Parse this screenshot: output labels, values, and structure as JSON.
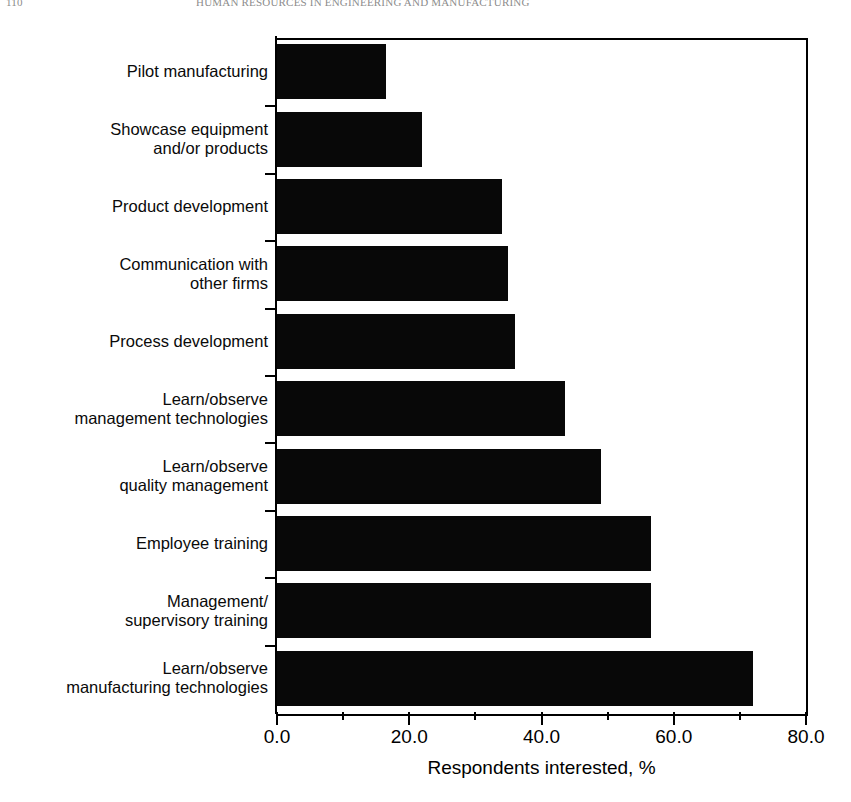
{
  "page": {
    "running_head_folio": "110",
    "running_head_title": "HUMAN RESOURCES IN ENGINEERING AND MANUFACTURING"
  },
  "chart_data": {
    "type": "bar",
    "orientation": "horizontal",
    "title": "",
    "xlabel": "Respondents interested, %",
    "ylabel": "",
    "xlim": [
      0.0,
      80.0
    ],
    "xticks": [
      "0.0",
      "20.0",
      "40.0",
      "60.0",
      "80.0"
    ],
    "xtick_values": [
      0,
      20,
      40,
      60,
      80
    ],
    "minor_tick_values": [
      10,
      30,
      50,
      70
    ],
    "grid": false,
    "legend": null,
    "bar_color": "#080808",
    "categories": [
      "Pilot manufacturing",
      "Showcase equipment\nand/or products",
      "Product development",
      "Communication with\nother firms",
      "Process development",
      "Learn/observe\nmanagement technologies",
      "Learn/observe\nquality management",
      "Employee training",
      "Management/\nsupervisory training",
      "Learn/observe\nmanufacturing technologies"
    ],
    "values": [
      16.5,
      22.0,
      34.0,
      35.0,
      36.0,
      43.5,
      49.0,
      56.5,
      56.5,
      72.0
    ]
  }
}
